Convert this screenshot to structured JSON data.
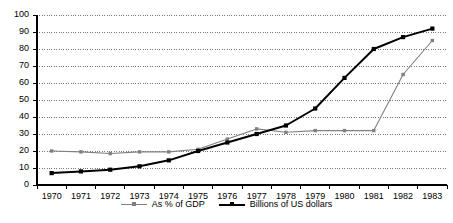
{
  "chart_data": {
    "type": "line",
    "title": "",
    "subtitle": "",
    "xlabel": "",
    "ylabel": "",
    "categories": [
      "1970",
      "1971",
      "1972",
      "1973",
      "1974",
      "1975",
      "1976",
      "1977",
      "1978",
      "1979",
      "1980",
      "1981",
      "1982",
      "1983"
    ],
    "x": [
      1970,
      1971,
      1972,
      1973,
      1974,
      1975,
      1976,
      1977,
      1978,
      1979,
      1980,
      1981,
      1982,
      1983
    ],
    "series": [
      {
        "name": "As % of GDP",
        "color": "#808080",
        "marker": "square",
        "values": [
          20,
          19.5,
          18.5,
          19.5,
          19.5,
          21,
          27,
          33,
          31,
          32,
          32,
          32,
          65,
          85
        ]
      },
      {
        "name": "Billions of US dollars",
        "color": "#000000",
        "marker": "square",
        "values": [
          7,
          8,
          9,
          11,
          14.5,
          20,
          25,
          30,
          35,
          45,
          63,
          80,
          87,
          92
        ]
      }
    ],
    "ylim": [
      0,
      100
    ],
    "yticks": [
      0,
      10,
      20,
      30,
      40,
      50,
      60,
      70,
      80,
      90,
      100
    ],
    "ytick_labels": [
      "0",
      "10",
      "20",
      "30",
      "40",
      "50",
      "60",
      "70",
      "80",
      "90",
      "100"
    ],
    "xtick_labels": [
      "1970",
      "1971",
      "1972",
      "1973",
      "1974",
      "1975",
      "1976",
      "1977",
      "1978",
      "1979",
      "1980",
      "1981",
      "1982",
      "1983"
    ],
    "grid": "horizontal-dotted",
    "grid_color": "#555555",
    "axis_color": "#000000",
    "legend_position": "bottom",
    "legend_entries": [
      "As % of GDP",
      "Billions of US dollars"
    ],
    "background": "#ffffff"
  }
}
